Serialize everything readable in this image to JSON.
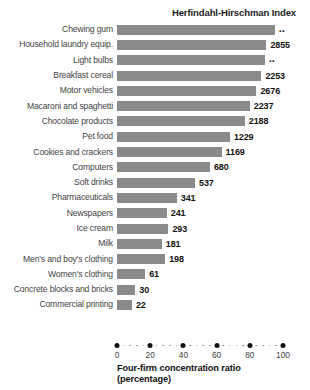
{
  "chart_data": {
    "type": "bar",
    "orientation": "horizontal",
    "title": "Herfindahl-Hirschman Index",
    "xlabel": "Four-firm concentration ratio",
    "xlabel_sub": "(percentage)",
    "ylabel": "",
    "xlim": [
      0,
      100
    ],
    "xticks": [
      0,
      20,
      40,
      60,
      80,
      100
    ],
    "xticklabels": [
      "0",
      "20",
      "40",
      "60",
      "80",
      "100"
    ],
    "grid": false,
    "legend": false,
    "bar_color": "#8a8a8a",
    "categories": [
      "Chewing gum",
      "Household laundry equip.",
      "Light bulbs",
      "Breakfast cereal",
      "Motor vehicles",
      "Macaroni and spaghetti",
      "Chocolate products",
      "Pet food",
      "Cookies and crackers",
      "Computers",
      "Soft drinks",
      "Pharmaceuticals",
      "Newspapers",
      "Ice cream",
      "Milk",
      "Men's and boy's clothing",
      "Women's clothing",
      "Concrete blocks and bricks",
      "Commercial printing"
    ],
    "values": [
      95,
      90,
      89,
      87,
      84,
      80,
      77,
      68,
      63,
      56,
      47,
      36,
      30,
      31,
      27,
      29,
      17,
      11,
      9
    ],
    "data_labels": [
      "..",
      "2855",
      "..",
      "2253",
      "2676",
      "2237",
      "2188",
      "1229",
      "1169",
      "680",
      "537",
      "341",
      "241",
      "293",
      "181",
      "198",
      "61",
      "30",
      "22"
    ],
    "series": [
      {
        "name": "Four-firm concentration ratio (percentage)",
        "values": [
          95,
          90,
          89,
          87,
          84,
          80,
          77,
          68,
          63,
          56,
          47,
          36,
          30,
          31,
          27,
          29,
          17,
          11,
          9
        ]
      },
      {
        "name": "Herfindahl-Hirschman Index",
        "values": [
          null,
          2855,
          null,
          2253,
          2676,
          2237,
          2188,
          1229,
          1169,
          680,
          537,
          341,
          241,
          293,
          181,
          198,
          61,
          30,
          22
        ]
      }
    ]
  }
}
